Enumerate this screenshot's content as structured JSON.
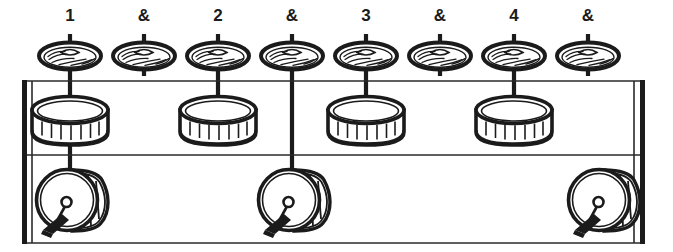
{
  "figure": {
    "width": 673,
    "height": 252,
    "background_color": "#ffffff",
    "ink_color": "#1b1b1b"
  },
  "beat_labels": [
    {
      "text": "1",
      "x": 70
    },
    {
      "text": "&",
      "x": 144
    },
    {
      "text": "2",
      "x": 218
    },
    {
      "text": "&",
      "x": 292
    },
    {
      "text": "3",
      "x": 366
    },
    {
      "text": "&",
      "x": 440
    },
    {
      "text": "4",
      "x": 514
    },
    {
      "text": "&",
      "x": 588
    }
  ],
  "grid": {
    "label_row_y": 17,
    "cymbal_row_y": 56,
    "snare_row_y": 118,
    "bass_row_y": 198,
    "staff_top_y": 81,
    "staff_middle_y": 155,
    "staff_bottom_y": 243,
    "staff_left_x": 22,
    "staff_right_x": 645,
    "column_spacing": 74
  },
  "columns": [
    {
      "index": 0,
      "beat": "1",
      "x": 70,
      "cymbal": true,
      "snare": true,
      "bass": true,
      "stem_to_snare": true,
      "stem_to_bass": true
    },
    {
      "index": 1,
      "beat": "&",
      "x": 144,
      "cymbal": true,
      "snare": false,
      "bass": false,
      "stem_to_snare": false,
      "stem_to_bass": false
    },
    {
      "index": 2,
      "beat": "2",
      "x": 218,
      "cymbal": true,
      "snare": true,
      "bass": false,
      "stem_to_snare": true,
      "stem_to_bass": false
    },
    {
      "index": 3,
      "beat": "&",
      "x": 292,
      "cymbal": true,
      "snare": false,
      "bass": true,
      "stem_to_snare": false,
      "stem_to_bass": true
    },
    {
      "index": 4,
      "beat": "3",
      "x": 366,
      "cymbal": true,
      "snare": true,
      "bass": false,
      "stem_to_snare": true,
      "stem_to_bass": false
    },
    {
      "index": 5,
      "beat": "&",
      "x": 440,
      "cymbal": true,
      "snare": false,
      "bass": false,
      "stem_to_snare": false,
      "stem_to_bass": false
    },
    {
      "index": 6,
      "beat": "4",
      "x": 514,
      "cymbal": true,
      "snare": true,
      "bass": false,
      "stem_to_snare": true,
      "stem_to_bass": false
    },
    {
      "index": 7,
      "beat": "&",
      "x": 588,
      "cymbal": true,
      "snare": false,
      "bass": true,
      "stem_to_snare": false,
      "stem_to_bass": false
    }
  ],
  "instruments": {
    "cymbal": {
      "name": "hi-hat-cymbal",
      "count": 8,
      "row": "top"
    },
    "snare": {
      "name": "snare-drum",
      "count": 4,
      "row": "middle"
    },
    "bass": {
      "name": "bass-drum-with-pedal",
      "count": 3,
      "row": "bottom"
    }
  }
}
